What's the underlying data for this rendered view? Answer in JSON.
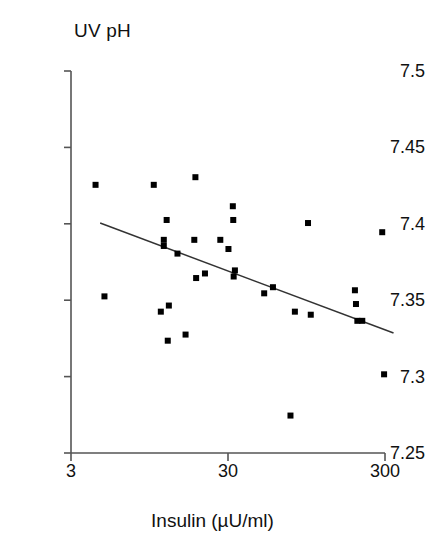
{
  "chart_data": {
    "type": "scatter",
    "title": "",
    "xlabel": "Insulin (µU/ml)",
    "ylabel": "UV pH",
    "xscale": "log",
    "yscale": "linear",
    "xlim": [
      3,
      300
    ],
    "ylim": [
      7.25,
      7.5
    ],
    "xticks": [
      3,
      30,
      300
    ],
    "xtick_labels": [
      "3",
      "30",
      "300"
    ],
    "yticks": [
      7.25,
      7.3,
      7.35,
      7.4,
      7.45,
      7.5
    ],
    "ytick_labels": [
      "7.25",
      "7.3",
      "7.35",
      "7.4",
      "7.45",
      "7.5"
    ],
    "grid": false,
    "legend": false,
    "marker": "square",
    "marker_color": "#000000",
    "points": [
      {
        "x": 4.3,
        "y": 7.4255
      },
      {
        "x": 4.9,
        "y": 7.3525
      },
      {
        "x": 10.1,
        "y": 7.4255
      },
      {
        "x": 12.2,
        "y": 7.4025
      },
      {
        "x": 11.7,
        "y": 7.3895
      },
      {
        "x": 11.7,
        "y": 7.3855
      },
      {
        "x": 11.2,
        "y": 7.3425
      },
      {
        "x": 12.6,
        "y": 7.3465
      },
      {
        "x": 12.4,
        "y": 7.3235
      },
      {
        "x": 14.3,
        "y": 7.3805
      },
      {
        "x": 16.1,
        "y": 7.3275
      },
      {
        "x": 18.3,
        "y": 7.3895
      },
      {
        "x": 18.6,
        "y": 7.4305
      },
      {
        "x": 18.8,
        "y": 7.3645
      },
      {
        "x": 21.4,
        "y": 7.3675
      },
      {
        "x": 26.8,
        "y": 7.3895
      },
      {
        "x": 30.2,
        "y": 7.3835
      },
      {
        "x": 32.2,
        "y": 7.4115
      },
      {
        "x": 32.4,
        "y": 7.4025
      },
      {
        "x": 33.2,
        "y": 7.3695
      },
      {
        "x": 32.6,
        "y": 7.3655
      },
      {
        "x": 51.0,
        "y": 7.3545
      },
      {
        "x": 58.0,
        "y": 7.3585
      },
      {
        "x": 75.0,
        "y": 7.2745
      },
      {
        "x": 80.0,
        "y": 7.3425
      },
      {
        "x": 97.0,
        "y": 7.4005
      },
      {
        "x": 101.0,
        "y": 7.3405
      },
      {
        "x": 193.0,
        "y": 7.3565
      },
      {
        "x": 196.0,
        "y": 7.3475
      },
      {
        "x": 200.0,
        "y": 7.3365
      },
      {
        "x": 215.0,
        "y": 7.3365
      },
      {
        "x": 288.0,
        "y": 7.3945
      },
      {
        "x": 296.0,
        "y": 7.3015
      }
    ],
    "fit_line": {
      "type": "linear-regression-on-log-x",
      "x_start": 4.6,
      "y_start": 7.4005,
      "x_end": 340.0,
      "y_end": 7.3285,
      "color": "#333333"
    }
  },
  "axes": {
    "axis_color": "#555555",
    "tick_color": "#555555"
  }
}
